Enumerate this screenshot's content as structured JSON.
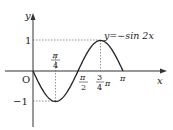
{
  "chart_data": {
    "type": "line",
    "title": "",
    "function_label": "y=−sin 2x",
    "xlabel": "x",
    "ylabel": "y",
    "origin_label": "O",
    "x_ticks": [
      {
        "value": 0.7854,
        "num": "π",
        "den": "4",
        "position": "above"
      },
      {
        "value": 1.5708,
        "num": "π",
        "den": "2",
        "position": "below"
      },
      {
        "value": 2.3562,
        "num": "3",
        "den": "4",
        "suffix": "π",
        "position": "below"
      },
      {
        "value": 3.1416,
        "label": "π",
        "position": "below"
      }
    ],
    "y_ticks": [
      {
        "value": 1,
        "label": "1"
      },
      {
        "value": -1,
        "label": "−1"
      }
    ],
    "xlim": [
      0,
      3.1416
    ],
    "ylim": [
      -1,
      1
    ],
    "grid": false,
    "guides": [
      {
        "from": [
          0,
          1
        ],
        "to": [
          2.3562,
          1
        ]
      },
      {
        "from": [
          2.3562,
          0
        ],
        "to": [
          2.3562,
          1
        ]
      },
      {
        "from": [
          0,
          -1
        ],
        "to": [
          0.7854,
          -1
        ]
      },
      {
        "from": [
          0.7854,
          0
        ],
        "to": [
          0.7854,
          -1
        ]
      }
    ],
    "series": [
      {
        "name": "y=-sin 2x",
        "x": [
          0,
          0.3927,
          0.7854,
          1.1781,
          1.5708,
          1.9635,
          2.3562,
          2.7489,
          3.1416
        ],
        "y": [
          0,
          -0.7071,
          -1,
          -0.7071,
          0,
          0.7071,
          1,
          0.7071,
          0
        ]
      }
    ]
  }
}
